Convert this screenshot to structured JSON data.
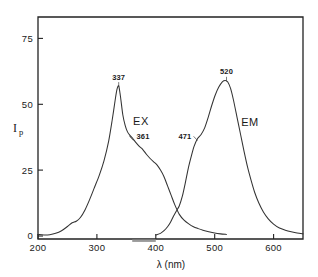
{
  "chart_data": {
    "type": "line",
    "title": "",
    "xlabel": "λ (nm)",
    "ylabel": "Ip",
    "ylabel_main": "I",
    "ylabel_sub": "p",
    "xlim": [
      200,
      650
    ],
    "ylim": [
      0,
      82
    ],
    "grid": false,
    "legend_position": "inline-annotation",
    "xticks": [
      200,
      300,
      400,
      500,
      600
    ],
    "xtick_labels": [
      "200",
      "300",
      "400",
      "500",
      "600"
    ],
    "yticks": [
      0,
      25,
      50,
      75
    ],
    "ytick_labels": [
      "0",
      "25",
      "50",
      "75"
    ],
    "series": [
      {
        "name": "EX",
        "label": "EX",
        "description": "Excitation spectrum",
        "peak_x": 337,
        "peak_y": 57,
        "shoulder_x": 361,
        "shoulder_y": 37,
        "x": [
          200,
          210,
          220,
          230,
          240,
          250,
          258,
          265,
          272,
          280,
          288,
          296,
          304,
          312,
          320,
          326,
          331,
          334,
          337,
          340,
          344,
          348,
          352,
          356,
          361,
          366,
          372,
          378,
          384,
          390,
          396,
          402,
          408,
          414,
          420,
          426,
          432,
          440,
          448,
          456,
          464,
          472,
          480,
          490,
          500,
          510,
          520
        ],
        "y": [
          0.6,
          0.4,
          0.5,
          1.0,
          2.0,
          3.6,
          5.0,
          5.6,
          7.0,
          10.0,
          14.0,
          18.5,
          23.0,
          28.5,
          36.0,
          44.0,
          51.5,
          55.5,
          57.0,
          53.0,
          46.0,
          42.0,
          39.5,
          38.2,
          37.0,
          35.5,
          34.0,
          32.8,
          31.0,
          29.5,
          28.2,
          27.0,
          25.0,
          22.5,
          19.0,
          15.5,
          12.0,
          8.2,
          6.0,
          4.6,
          3.5,
          2.8,
          2.2,
          1.6,
          1.1,
          0.8,
          0.6
        ]
      },
      {
        "name": "EM",
        "label": "EM",
        "description": "Emission spectrum",
        "peak_x": 520,
        "peak_y": 59,
        "shoulder_x": 471,
        "shoulder_y": 37,
        "x": [
          400,
          408,
          414,
          420,
          425,
          430,
          435,
          440,
          445,
          450,
          455,
          460,
          465,
          471,
          477,
          483,
          489,
          495,
          501,
          507,
          513,
          518,
          522,
          527,
          532,
          538,
          544,
          550,
          556,
          562,
          568,
          575,
          583,
          591,
          600,
          610,
          620,
          630,
          640,
          650
        ],
        "y": [
          0.4,
          1.0,
          2.0,
          3.5,
          5.2,
          7.5,
          9.5,
          11.5,
          15.0,
          20.0,
          25.5,
          30.0,
          34.0,
          37.0,
          38.5,
          41.0,
          45.0,
          49.5,
          53.5,
          56.5,
          58.5,
          59.0,
          58.5,
          56.0,
          51.5,
          45.0,
          38.5,
          32.0,
          26.0,
          21.0,
          16.5,
          12.5,
          9.0,
          6.5,
          4.5,
          3.0,
          2.2,
          1.6,
          1.1,
          0.8
        ]
      }
    ],
    "annotations": [
      {
        "text": "337",
        "x": 337,
        "y": 57,
        "series": "EX",
        "kind": "peak-label"
      },
      {
        "text": "361",
        "x": 361,
        "y": 37,
        "series": "EX",
        "kind": "shoulder-label"
      },
      {
        "text": "471",
        "x": 471,
        "y": 37,
        "series": "EM",
        "kind": "shoulder-label"
      },
      {
        "text": "520",
        "x": 520,
        "y": 59,
        "series": "EM",
        "kind": "peak-label"
      },
      {
        "text": "EX",
        "x": 375,
        "y": 46,
        "series": "EX",
        "kind": "series-label"
      },
      {
        "text": "EM",
        "x": 560,
        "y": 45,
        "series": "EM",
        "kind": "series-label"
      }
    ],
    "range_bar": {
      "name": "bandpass-marker",
      "x_start": 360,
      "x_end": 400,
      "y": -1.8,
      "color": "#9a9a9a"
    }
  },
  "labels": {
    "xaxis_title": "λ (nm)",
    "yaxis_main": "I",
    "yaxis_sub": "p",
    "ex_label": "EX",
    "em_label": "EM",
    "peak_ex": "337",
    "shoulder_ex": "361",
    "shoulder_em": "471",
    "peak_em": "520",
    "xtick_200": "200",
    "xtick_300": "300",
    "xtick_400": "400",
    "xtick_500": "500",
    "xtick_600": "600",
    "ytick_0": "0",
    "ytick_25": "25",
    "ytick_50": "50",
    "ytick_75": "75"
  },
  "colors": {
    "background": "#ffffff",
    "axis": "#222222",
    "curve": "#333333",
    "text": "#1a1a1a",
    "range_bar": "#9a9a9a"
  }
}
